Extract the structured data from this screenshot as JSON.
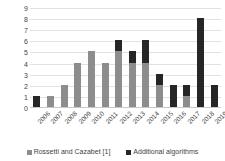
{
  "chart_data": {
    "type": "bar",
    "stacked": true,
    "title": "",
    "xlabel": "",
    "ylabel": "",
    "ylim": [
      0,
      9
    ],
    "yticks": [
      "0",
      "1",
      "2",
      "3",
      "4",
      "5",
      "6",
      "7",
      "8",
      "9"
    ],
    "grid": true,
    "legend_position": "bottom",
    "categories": [
      "2006",
      "2007",
      "2008",
      "2009",
      "2010",
      "2011",
      "2012",
      "2013",
      "2014",
      "2015",
      "2016",
      "2017",
      "2018",
      "2019"
    ],
    "series": [
      {
        "name": "Rossetti and Cazabet [1]",
        "color": "#8d8d8d",
        "values": [
          0,
          1,
          2,
          4,
          5,
          4,
          5,
          4,
          4,
          2,
          0,
          1,
          0,
          0
        ]
      },
      {
        "name": "Additional algorithms",
        "color": "#262626",
        "values": [
          1,
          0,
          0,
          0,
          0,
          0,
          1,
          1,
          2,
          1,
          2,
          1,
          8,
          2
        ]
      }
    ],
    "totals": [
      1,
      1,
      2,
      4,
      5,
      4,
      6,
      5,
      6,
      3,
      2,
      2,
      8,
      2
    ]
  },
  "legend": {
    "items": [
      {
        "label": "Rossetti and Cazabet [1]"
      },
      {
        "label": "Additional algorithms"
      }
    ]
  }
}
